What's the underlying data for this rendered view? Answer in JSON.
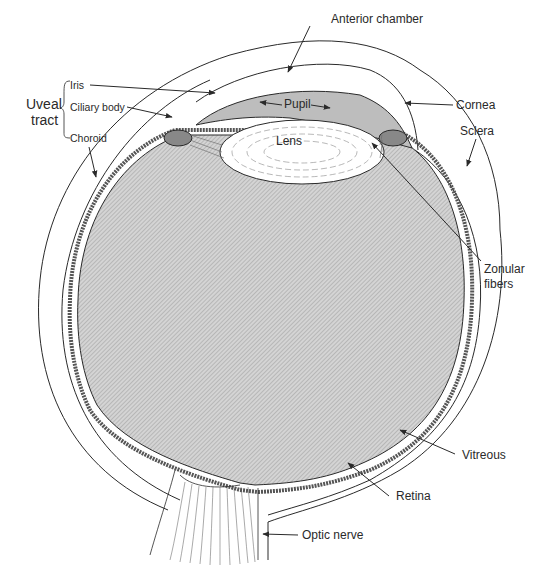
{
  "figure": {
    "type": "anatomical-cross-section"
  },
  "labels": {
    "anterior_chamber": "Anterior chamber",
    "iris": "Iris",
    "uveal_tract_line1": "Uveal",
    "uveal_tract_line2": "tract",
    "ciliary_body": "Ciliary body",
    "choroid": "Choroid",
    "pupil": "Pupil",
    "lens": "Lens",
    "cornea": "Cornea",
    "sclera": "Sclera",
    "zonular_fibers_line1": "Zonular",
    "zonular_fibers_line2": "fibers",
    "vitreous": "Vitreous",
    "retina": "Retina",
    "optic_nerve": "Optic nerve"
  },
  "colors": {
    "line": "#2a2a2a",
    "vitreous_fill": "#c9c9c9",
    "background": "#ffffff"
  }
}
